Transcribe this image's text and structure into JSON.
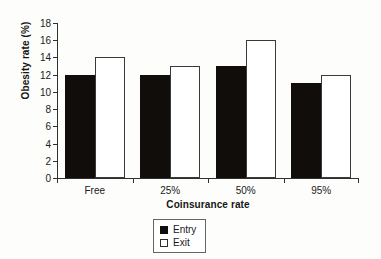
{
  "chart_data": {
    "type": "bar",
    "title": "",
    "xlabel": "Coinsurance rate",
    "ylabel": "Obesity rate (%)",
    "categories": [
      "Free",
      "25%",
      "50%",
      "95%"
    ],
    "series": [
      {
        "name": "Entry",
        "color": "#100d0b",
        "values": [
          12,
          12,
          13,
          11
        ]
      },
      {
        "name": "Exit",
        "color": "#ffffff",
        "values": [
          14,
          13,
          16,
          12
        ]
      }
    ],
    "ylim": [
      0,
      18
    ],
    "ytick_step": 2,
    "ytick_labels": [
      "0",
      "2",
      "4",
      "6",
      "8",
      "10",
      "12",
      "14",
      "16",
      "18"
    ],
    "grid": false,
    "legend_position": "bottom-center",
    "legend_entries": [
      "Entry",
      "Exit"
    ]
  }
}
